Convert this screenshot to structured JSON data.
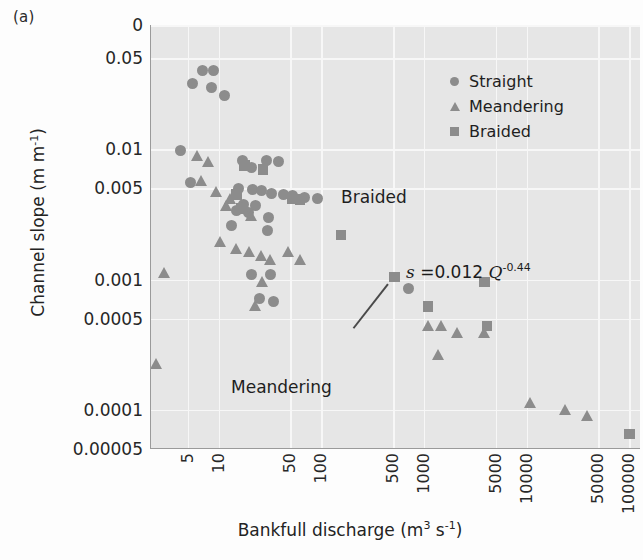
{
  "panel_label": "(a)",
  "colors": {
    "marker": "#8c8c8c",
    "plot_background": "#e6e6e6",
    "gridline": "#f7f7f7",
    "axis": "#9a9a9a",
    "text": "#232323"
  },
  "legend": {
    "position": "top-right-inside",
    "items": [
      {
        "label": "Straight",
        "marker": "circle",
        "icon": "circle-marker-icon"
      },
      {
        "label": "Meandering",
        "marker": "triangle",
        "icon": "triangle-marker-icon"
      },
      {
        "label": "Braided",
        "marker": "square",
        "icon": "square-marker-icon"
      }
    ]
  },
  "annotations": {
    "braided_zone": "Braided",
    "meandering_zone": "Meandering",
    "equation_plain": "s = 0.012 Q^-0.44",
    "equation_parts": {
      "lhs": "s",
      "eq": "=",
      "coefficient": "0.012",
      "variable": "Q",
      "exponent": "-0.44"
    }
  },
  "chart_data": {
    "type": "scatter",
    "title": "",
    "subtitle": "",
    "xlabel": "Bankfull discharge (m3 s-1)",
    "xlabel_parts": {
      "text": "Bankfull discharge (m",
      "sup1": "3",
      "mid": " s",
      "sup2": "-1",
      "end": ")"
    },
    "ylabel": "Channel slope (m m-1)",
    "ylabel_parts": {
      "text": "Channel slope (m m",
      "sup": "-1",
      "end": ")"
    },
    "xscale": "log",
    "yscale": "log",
    "grid": true,
    "xlim": [
      2.2,
      130000
    ],
    "ylim": [
      5e-05,
      0.09
    ],
    "xticks": [
      5,
      10,
      50,
      100,
      500,
      1000,
      5000,
      10000,
      50000,
      100000
    ],
    "xtick_labels": [
      "5",
      "10",
      "50",
      "100",
      "500",
      "1000",
      "5000",
      "10000",
      "50000",
      "100000"
    ],
    "yticks": [
      0.09,
      0.05,
      0.01,
      0.005,
      0.001,
      0.0005,
      0.0001,
      5e-05
    ],
    "ytick_labels": [
      "0",
      "0.05",
      "0.01",
      "0.005",
      "0.001",
      "0.0005",
      "0.0001",
      "0.00005"
    ],
    "trendline": {
      "label": "s = 0.012 Q^-0.44",
      "coefficient": 0.012,
      "exponent": -0.44,
      "drawn": false
    },
    "series": [
      {
        "name": "Straight",
        "marker": "circle",
        "points": [
          [
            7.0,
            0.04
          ],
          [
            9.0,
            0.04
          ],
          [
            5.6,
            0.032
          ],
          [
            8.6,
            0.03
          ],
          [
            11.5,
            0.026
          ],
          [
            4.3,
            0.0098
          ],
          [
            17.0,
            0.0082
          ],
          [
            29.0,
            0.0082
          ],
          [
            38.0,
            0.0081
          ],
          [
            21.0,
            0.0072
          ],
          [
            5.3,
            0.0056
          ],
          [
            15.5,
            0.005
          ],
          [
            21.5,
            0.0049
          ],
          [
            26.0,
            0.0048
          ],
          [
            33.0,
            0.0046
          ],
          [
            43.0,
            0.0045
          ],
          [
            52.0,
            0.0044
          ],
          [
            68.0,
            0.0043
          ],
          [
            92.0,
            0.0042
          ],
          [
            17.5,
            0.0038
          ],
          [
            23.0,
            0.0037
          ],
          [
            15.0,
            0.0034
          ],
          [
            19.5,
            0.0033
          ],
          [
            31.0,
            0.003
          ],
          [
            13.5,
            0.0026
          ],
          [
            30.0,
            0.0024
          ],
          [
            21.0,
            0.0011
          ],
          [
            32.0,
            0.0011
          ],
          [
            25.0,
            0.00072
          ],
          [
            34.0,
            0.00068
          ],
          [
            700.0,
            0.00085
          ]
        ]
      },
      {
        "name": "Meandering",
        "marker": "triangle",
        "points": [
          [
            6.3,
            0.0088
          ],
          [
            8.0,
            0.0078
          ],
          [
            6.8,
            0.0056
          ],
          [
            9.6,
            0.0046
          ],
          [
            13.0,
            0.0041
          ],
          [
            12.0,
            0.0036
          ],
          [
            17.0,
            0.0035
          ],
          [
            21.0,
            0.003
          ],
          [
            3.0,
            0.0011
          ],
          [
            10.5,
            0.0019
          ],
          [
            15.0,
            0.0017
          ],
          [
            20.0,
            0.0016
          ],
          [
            26.0,
            0.0015
          ],
          [
            32.0,
            0.0014
          ],
          [
            48.0,
            0.0016
          ],
          [
            63.0,
            0.0014
          ],
          [
            2.5,
            0.00022
          ],
          [
            27.0,
            0.00094
          ],
          [
            23.0,
            0.00062
          ],
          [
            1100.0,
            0.00043
          ],
          [
            1500.0,
            0.00043
          ],
          [
            2100.0,
            0.00038
          ],
          [
            3900.0,
            0.00038
          ],
          [
            1400.0,
            0.00026
          ],
          [
            11000.0,
            0.00011
          ],
          [
            24000.0,
            9.8e-05
          ],
          [
            39000.0,
            8.8e-05
          ]
        ]
      },
      {
        "name": "Braided",
        "marker": "square",
        "points": [
          [
            18.0,
            0.0075
          ],
          [
            27.0,
            0.007
          ],
          [
            15.0,
            0.0045
          ],
          [
            16.5,
            0.0035
          ],
          [
            52.0,
            0.0042
          ],
          [
            62.0,
            0.0041
          ],
          [
            155.0,
            0.0022
          ],
          [
            520.0,
            0.00105
          ],
          [
            1100.0,
            0.00062
          ],
          [
            3900.0,
            0.00096
          ],
          [
            4100.0,
            0.00044
          ],
          [
            100000.0,
            6.5e-05
          ]
        ]
      }
    ]
  }
}
